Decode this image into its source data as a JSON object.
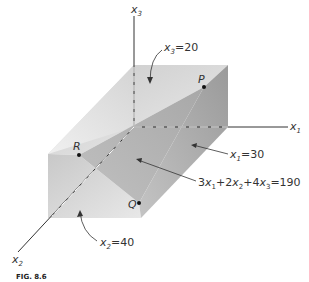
{
  "figure": {
    "caption": "FIG. 8.6",
    "axes": {
      "x1": {
        "label": "x",
        "sub": "1"
      },
      "x2": {
        "label": "x",
        "sub": "2"
      },
      "x3": {
        "label": "x",
        "sub": "3"
      }
    },
    "points": {
      "P": "P",
      "Q": "Q",
      "R": "R"
    },
    "annotations": {
      "x3_plane": {
        "pre": "x",
        "sub": "3",
        "post": "=20"
      },
      "x1_plane": {
        "pre": "x",
        "sub": "1",
        "post": "=30"
      },
      "x2_plane": {
        "pre": "x",
        "sub": "2",
        "post": "=40"
      },
      "cut_plane": {
        "t1": "3",
        "v1": "x",
        "s1": "1",
        "t2": "+2",
        "v2": "x",
        "s2": "2",
        "t3": "+4",
        "v3": "x",
        "s3": "3",
        "t4": "=190"
      }
    },
    "colors": {
      "top_face": "#d8d8d8",
      "left_face": "#e4e4e4",
      "front_face": "#d2d2d2",
      "right_face": "#a9a9a9",
      "cut_face": "#bdbdbd",
      "axis": "#333333"
    }
  }
}
